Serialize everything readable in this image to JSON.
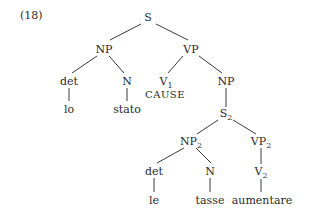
{
  "example_number": "(18)",
  "nodes": {
    "S": {
      "label": "S",
      "sub": ""
    },
    "NP": {
      "label": "NP",
      "sub": ""
    },
    "VP": {
      "label": "VP",
      "sub": ""
    },
    "det1": {
      "label": "det",
      "sub": ""
    },
    "N1": {
      "label": "N",
      "sub": ""
    },
    "lo": {
      "label": "lo",
      "sub": ""
    },
    "stato": {
      "label": "stato",
      "sub": ""
    },
    "V1": {
      "label": "V",
      "sub": "1"
    },
    "CAUSE": {
      "label": "CAUSE",
      "sub": ""
    },
    "NP_obj": {
      "label": "NP",
      "sub": ""
    },
    "S2": {
      "label": "S",
      "sub": "2"
    },
    "NP2": {
      "label": "NP",
      "sub": "2"
    },
    "VP2": {
      "label": "VP",
      "sub": "2"
    },
    "det2": {
      "label": "det",
      "sub": ""
    },
    "N2": {
      "label": "N",
      "sub": ""
    },
    "V2": {
      "label": "V",
      "sub": "2"
    },
    "le": {
      "label": "le",
      "sub": ""
    },
    "tasse": {
      "label": "tasse",
      "sub": ""
    },
    "aumentare": {
      "label": "aumentare",
      "sub": ""
    }
  }
}
